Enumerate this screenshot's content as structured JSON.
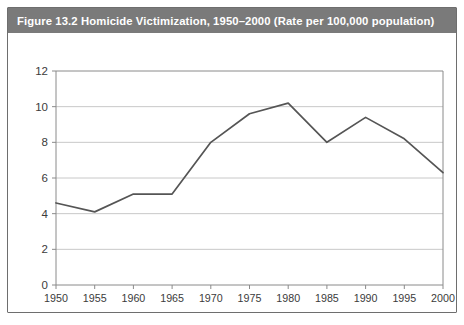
{
  "figure": {
    "caption": "Figure 13.2   Homicide Victimization, 1950–2000 (Rate per 100,000 population)",
    "caption_bar_color": "#7a7a7a",
    "frame_border_color": "#6e6e6e",
    "background_color": "#ffffff"
  },
  "chart_data": {
    "type": "line",
    "title": "Figure 13.2   Homicide Victimization, 1950–2000 (Rate per 100,000 population)",
    "xlabel": "",
    "ylabel": "",
    "x": [
      1950,
      1955,
      1960,
      1965,
      1970,
      1975,
      1980,
      1985,
      1990,
      1995,
      2000
    ],
    "values": [
      4.6,
      4.1,
      5.1,
      5.1,
      8.0,
      9.6,
      10.2,
      8.0,
      9.4,
      8.2,
      6.3
    ],
    "series": [
      {
        "name": "Homicide victimization rate",
        "values": [
          4.6,
          4.1,
          5.1,
          5.1,
          8.0,
          9.6,
          10.2,
          8.0,
          9.4,
          8.2,
          6.3
        ],
        "color": "#555555"
      }
    ],
    "x_tick_labels": [
      "1950",
      "1955",
      "1960",
      "1965",
      "1970",
      "1975",
      "1980",
      "1985",
      "1990",
      "1995",
      "2000"
    ],
    "y_tick_labels": [
      "0",
      "2",
      "4",
      "6",
      "8",
      "10",
      "12"
    ],
    "y_ticks": [
      0,
      2,
      4,
      6,
      8,
      10,
      12
    ],
    "xlim": [
      1950,
      2000
    ],
    "ylim": [
      0,
      12
    ],
    "grid": true,
    "grid_color": "#c8c8c8",
    "axis_color": "#8a8a8a",
    "legend": null,
    "legend_position": "none"
  }
}
